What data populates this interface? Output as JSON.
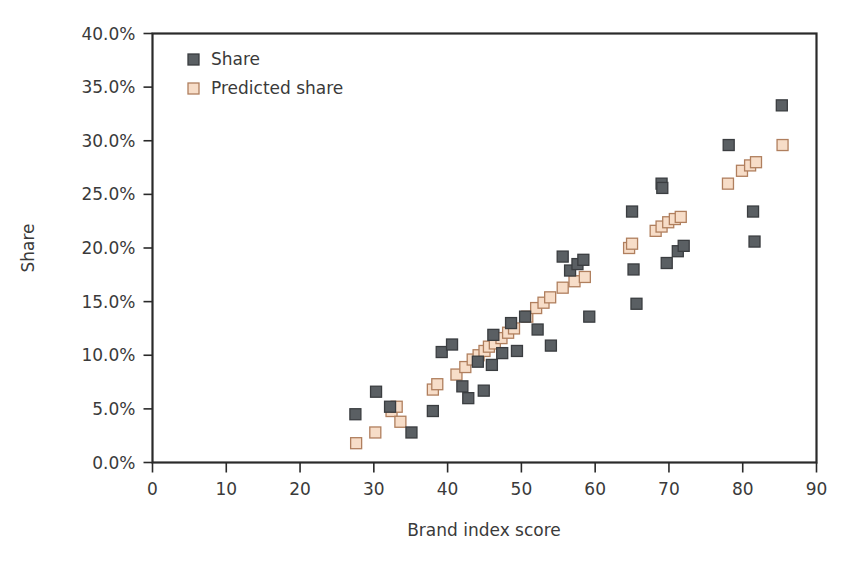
{
  "chart_data": {
    "type": "scatter",
    "title": "",
    "xlabel": "Brand index score",
    "ylabel": "Share",
    "xlim": [
      0,
      90
    ],
    "ylim": [
      0,
      0.4
    ],
    "grid": false,
    "legend_position": "top-left inside",
    "x_ticks": [
      "0",
      "10",
      "20",
      "30",
      "40",
      "50",
      "60",
      "70",
      "80",
      "90"
    ],
    "x_tick_values": [
      0,
      10,
      20,
      30,
      40,
      50,
      60,
      70,
      80,
      90
    ],
    "y_ticks": [
      "0.0%",
      "5.0%",
      "10.0%",
      "15.0%",
      "20.0%",
      "25.0%",
      "30.0%",
      "35.0%",
      "40.0%"
    ],
    "y_tick_values": [
      0,
      5,
      10,
      15,
      20,
      25,
      30,
      35,
      40
    ],
    "series": [
      {
        "name": "Share",
        "marker": "filled-square",
        "color": "#5a5f63",
        "edge_color": "#3a3d40",
        "points": [
          {
            "x": 27.5,
            "y": 4.5
          },
          {
            "x": 30.3,
            "y": 6.6
          },
          {
            "x": 32.2,
            "y": 5.2
          },
          {
            "x": 35.1,
            "y": 2.8
          },
          {
            "x": 38.0,
            "y": 4.8
          },
          {
            "x": 39.2,
            "y": 10.3
          },
          {
            "x": 40.6,
            "y": 11.0
          },
          {
            "x": 42.0,
            "y": 7.1
          },
          {
            "x": 42.8,
            "y": 6.0
          },
          {
            "x": 44.1,
            "y": 9.4
          },
          {
            "x": 44.9,
            "y": 6.7
          },
          {
            "x": 46.2,
            "y": 11.9
          },
          {
            "x": 46.0,
            "y": 9.1
          },
          {
            "x": 47.4,
            "y": 10.2
          },
          {
            "x": 48.6,
            "y": 13.0
          },
          {
            "x": 49.4,
            "y": 10.4
          },
          {
            "x": 50.5,
            "y": 13.6
          },
          {
            "x": 52.2,
            "y": 12.4
          },
          {
            "x": 54.0,
            "y": 10.9
          },
          {
            "x": 55.6,
            "y": 19.2
          },
          {
            "x": 56.6,
            "y": 17.9
          },
          {
            "x": 57.6,
            "y": 18.5
          },
          {
            "x": 58.4,
            "y": 18.9
          },
          {
            "x": 59.2,
            "y": 13.6
          },
          {
            "x": 65.0,
            "y": 23.4
          },
          {
            "x": 65.2,
            "y": 18.0
          },
          {
            "x": 65.6,
            "y": 14.8
          },
          {
            "x": 69.0,
            "y": 26.0
          },
          {
            "x": 69.1,
            "y": 25.6
          },
          {
            "x": 69.7,
            "y": 18.6
          },
          {
            "x": 71.2,
            "y": 19.7
          },
          {
            "x": 72.0,
            "y": 20.2
          },
          {
            "x": 78.1,
            "y": 29.6
          },
          {
            "x": 81.4,
            "y": 23.4
          },
          {
            "x": 81.6,
            "y": 20.6
          },
          {
            "x": 85.3,
            "y": 33.3
          }
        ]
      },
      {
        "name": "Predicted share",
        "marker": "open-square",
        "color": "#f7ddc8",
        "edge_color": "#b07f5e",
        "points": [
          {
            "x": 27.6,
            "y": 1.8
          },
          {
            "x": 30.2,
            "y": 2.8
          },
          {
            "x": 32.4,
            "y": 4.8
          },
          {
            "x": 33.1,
            "y": 5.2
          },
          {
            "x": 33.6,
            "y": 3.8
          },
          {
            "x": 38.0,
            "y": 6.8
          },
          {
            "x": 38.6,
            "y": 7.3
          },
          {
            "x": 41.2,
            "y": 8.2
          },
          {
            "x": 42.4,
            "y": 8.9
          },
          {
            "x": 43.4,
            "y": 9.6
          },
          {
            "x": 44.2,
            "y": 10.0
          },
          {
            "x": 45.0,
            "y": 10.4
          },
          {
            "x": 45.6,
            "y": 10.8
          },
          {
            "x": 46.4,
            "y": 11.1
          },
          {
            "x": 47.3,
            "y": 11.6
          },
          {
            "x": 48.2,
            "y": 12.1
          },
          {
            "x": 49.0,
            "y": 12.5
          },
          {
            "x": 50.8,
            "y": 13.6
          },
          {
            "x": 52.0,
            "y": 14.4
          },
          {
            "x": 53.0,
            "y": 14.9
          },
          {
            "x": 53.9,
            "y": 15.4
          },
          {
            "x": 55.6,
            "y": 16.3
          },
          {
            "x": 57.2,
            "y": 16.9
          },
          {
            "x": 58.6,
            "y": 17.3
          },
          {
            "x": 64.6,
            "y": 20.0
          },
          {
            "x": 65.0,
            "y": 20.4
          },
          {
            "x": 68.2,
            "y": 21.6
          },
          {
            "x": 69.0,
            "y": 22.0
          },
          {
            "x": 69.9,
            "y": 22.4
          },
          {
            "x": 70.8,
            "y": 22.7
          },
          {
            "x": 71.6,
            "y": 22.9
          },
          {
            "x": 78.0,
            "y": 26.0
          },
          {
            "x": 79.9,
            "y": 27.2
          },
          {
            "x": 81.0,
            "y": 27.7
          },
          {
            "x": 81.8,
            "y": 28.0
          },
          {
            "x": 85.4,
            "y": 29.6
          }
        ]
      }
    ]
  },
  "legend": {
    "items": [
      {
        "label": "Share"
      },
      {
        "label": "Predicted share"
      }
    ]
  },
  "axes": {
    "x_title": "Brand index score",
    "y_title": "Share"
  },
  "colors": {
    "share_fill": "#5a5f63",
    "share_edge": "#3a3d40",
    "predicted_fill": "#f7ddc8",
    "predicted_edge": "#b07f5e",
    "frame": "#2a2a2a",
    "text": "#3a3a3a",
    "background": "#ffffff"
  }
}
